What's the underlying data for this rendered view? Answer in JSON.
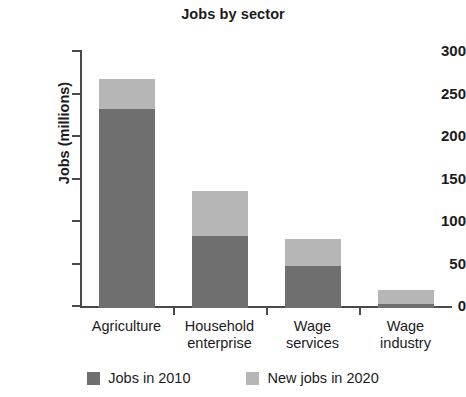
{
  "chart_data": {
    "type": "bar",
    "subtype": "stacked-vertical",
    "title": "Jobs by sector",
    "xlabel": "",
    "ylabel": "Jobs (millions)",
    "ylim": [
      0,
      300
    ],
    "yticks": [
      0,
      50,
      100,
      150,
      200,
      250,
      300
    ],
    "ytick_labels": [
      "0",
      "50",
      "100",
      "150",
      "200",
      "250",
      "300"
    ],
    "grid": false,
    "legend_position": "bottom",
    "categories": [
      "Agriculture",
      "Household enterprise",
      "Wage services",
      "Wage industry"
    ],
    "category_lines": [
      [
        "Agriculture"
      ],
      [
        "Household",
        "enterprise"
      ],
      [
        "Wage",
        "services"
      ],
      [
        "Wage",
        "industry"
      ]
    ],
    "series": [
      {
        "name": "Jobs in 2010",
        "color": "#6f6f6f",
        "values": [
          234,
          85,
          50,
          5
        ]
      },
      {
        "name": "New jobs in 2020",
        "color": "#b6b6b6",
        "values": [
          35,
          53,
          31,
          16
        ]
      }
    ],
    "totals": [
      269,
      138,
      81,
      21
    ]
  },
  "legend": {
    "items": [
      {
        "label": "Jobs in 2010",
        "color": "#6f6f6f"
      },
      {
        "label": "New jobs in 2020",
        "color": "#b6b6b6"
      }
    ]
  },
  "colors": {
    "axis": "#4a4a4a",
    "text": "#1b1b1b",
    "background": "#ffffff",
    "series_2010": "#6f6f6f",
    "series_2020": "#b6b6b6"
  }
}
